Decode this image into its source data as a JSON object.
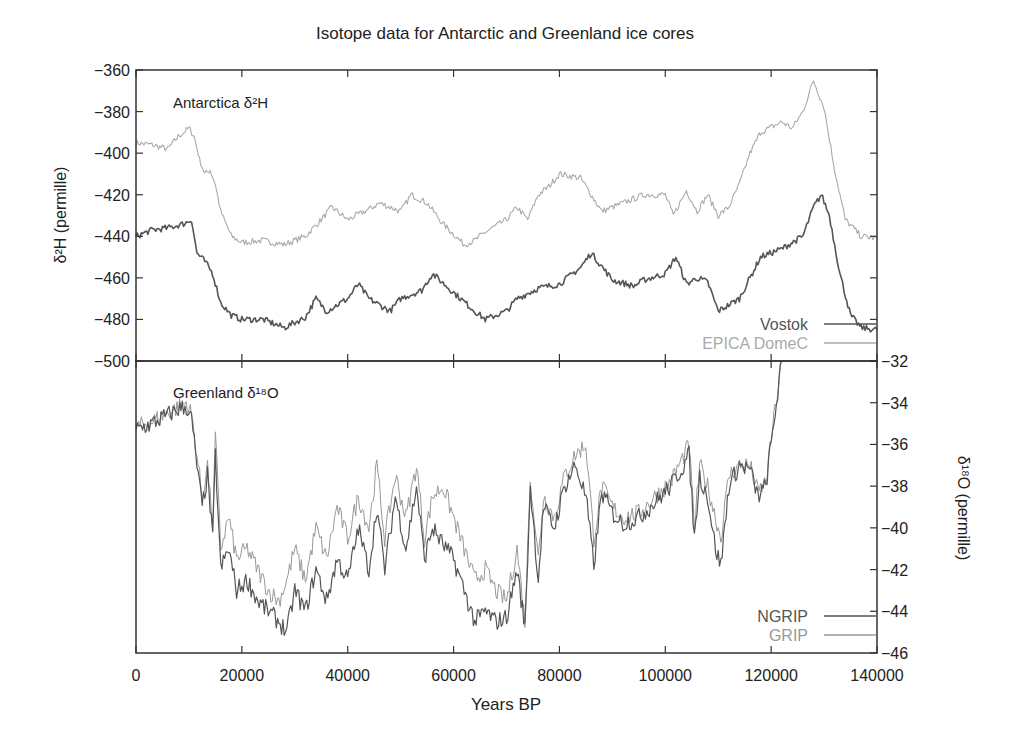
{
  "chart_data": {
    "type": "line",
    "title": "Isotope data for Antarctic and Greenland ice cores",
    "xlabel": "Years BP",
    "xlim": [
      0,
      140000
    ],
    "x_ticks": [
      0,
      20000,
      40000,
      60000,
      80000,
      100000,
      120000,
      140000
    ],
    "x_tick_labels": [
      "0",
      "20000",
      "40000",
      "60000",
      "80000",
      "100000",
      "120000",
      "140000"
    ],
    "grid": false,
    "panels": [
      {
        "name": "Antarctica",
        "panel_label": "Antarctica δ²H",
        "ylabel": "δ²H (permille)",
        "y_axis_side": "left",
        "ylim": [
          -500,
          -360
        ],
        "y_ticks": [
          -360,
          -380,
          -400,
          -420,
          -440,
          -460,
          -480,
          -500
        ],
        "y_tick_labels": [
          "−360",
          "−380",
          "−400",
          "−420",
          "−440",
          "−460",
          "−480",
          "−500"
        ],
        "legend_position": "lower right",
        "series": [
          {
            "name": "Vostok",
            "color": "#555555",
            "x": [
              0,
              3000,
              6000,
              9000,
              10500,
              11500,
              13000,
              14500,
              16000,
              18000,
              20000,
              24000,
              28000,
              32000,
              34000,
              36000,
              40000,
              42000,
              44000,
              46000,
              48000,
              50000,
              54000,
              56000,
              60000,
              64000,
              66000,
              70000,
              72000,
              76000,
              80000,
              84000,
              86000,
              90000,
              94000,
              96000,
              100000,
              102000,
              104000,
              106000,
              108000,
              110000,
              114000,
              118000,
              122000,
              126000,
              128000,
              129500,
              131000,
              133000,
              135000,
              137000,
              140000
            ],
            "y": [
              -440,
              -437,
              -436,
              -434,
              -432,
              -448,
              -452,
              -458,
              -472,
              -478,
              -480,
              -480,
              -484,
              -479,
              -470,
              -476,
              -470,
              -463,
              -470,
              -473,
              -476,
              -470,
              -466,
              -458,
              -467,
              -476,
              -480,
              -476,
              -470,
              -465,
              -463,
              -455,
              -448,
              -461,
              -464,
              -461,
              -458,
              -450,
              -463,
              -460,
              -462,
              -476,
              -470,
              -450,
              -446,
              -440,
              -426,
              -420,
              -430,
              -458,
              -478,
              -484,
              -485
            ]
          },
          {
            "name": "EPICA DomeC",
            "color": "#aaaaaa",
            "x": [
              0,
              3000,
              6000,
              8000,
              10000,
              11000,
              12000,
              13000,
              14000,
              15000,
              16000,
              18000,
              20000,
              24000,
              28000,
              32000,
              35000,
              37000,
              40000,
              44000,
              46000,
              50000,
              52000,
              55000,
              58000,
              62000,
              64000,
              66000,
              70000,
              72000,
              74000,
              76000,
              78000,
              80000,
              84000,
              86000,
              88000,
              92000,
              96000,
              100000,
              101500,
              104000,
              106000,
              108000,
              110000,
              112000,
              114000,
              116000,
              118000,
              122000,
              124000,
              126000,
              128000,
              130000,
              132000,
              134000,
              137000,
              140000
            ],
            "y": [
              -395,
              -396,
              -398,
              -392,
              -388,
              -392,
              -403,
              -410,
              -408,
              -415,
              -428,
              -440,
              -443,
              -442,
              -444,
              -440,
              -432,
              -426,
              -432,
              -427,
              -424,
              -428,
              -420,
              -424,
              -434,
              -444,
              -442,
              -438,
              -432,
              -426,
              -432,
              -420,
              -416,
              -410,
              -412,
              -420,
              -428,
              -424,
              -420,
              -420,
              -430,
              -418,
              -428,
              -420,
              -430,
              -426,
              -415,
              -400,
              -390,
              -385,
              -388,
              -380,
              -365,
              -378,
              -408,
              -432,
              -440,
              -441
            ]
          }
        ]
      },
      {
        "name": "Greenland",
        "panel_label": "Greenland δ¹⁸O",
        "ylabel": "δ¹⁸O (permille)",
        "y_axis_side": "right",
        "ylim": [
          -46,
          -32
        ],
        "y_ticks": [
          -32,
          -34,
          -36,
          -38,
          -40,
          -42,
          -44,
          -46
        ],
        "y_tick_labels": [
          "−32",
          "−34",
          "−36",
          "−38",
          "−40",
          "−42",
          "−44",
          "−46"
        ],
        "legend_position": "lower right",
        "series": [
          {
            "name": "NGRIP",
            "color": "#555555",
            "x": [
              0,
              3000,
              6000,
              8000,
              9500,
              10500,
              11500,
              12500,
              13500,
              14500,
              15000,
              16000,
              17500,
              19000,
              21000,
              23000,
              25000,
              27000,
              28500,
              30000,
              32000,
              34000,
              36000,
              38000,
              40000,
              42000,
              44000,
              45500,
              47000,
              49000,
              51000,
              53000,
              54500,
              56000,
              58000,
              60000,
              62000,
              64000,
              66000,
              68000,
              70000,
              72000,
              73500,
              74500,
              76000,
              77000,
              79000,
              81000,
              83000,
              85000,
              86500,
              88000,
              90000,
              92000,
              95000,
              98000,
              101000,
              103000,
              104500,
              105500,
              106500,
              108000,
              109500,
              110500,
              112000,
              114000,
              116000,
              117500,
              119000,
              120500,
              122000
            ],
            "y": [
              -35.3,
              -35.0,
              -34.6,
              -34.3,
              -34.2,
              -34.8,
              -37.0,
              -39.0,
              -37.5,
              -40.5,
              -36.5,
              -42.0,
              -41.0,
              -43.0,
              -42.5,
              -43.5,
              -44.0,
              -44.5,
              -45.0,
              -43.0,
              -44.0,
              -42.0,
              -43.5,
              -41.5,
              -42.5,
              -40.0,
              -42.0,
              -39.0,
              -42.0,
              -38.5,
              -41.0,
              -38.0,
              -41.5,
              -40.0,
              -40.8,
              -41.5,
              -43.0,
              -44.5,
              -44.0,
              -44.5,
              -44.3,
              -42.0,
              -44.8,
              -38.0,
              -42.5,
              -39.0,
              -40.0,
              -38.0,
              -37.0,
              -38.5,
              -41.8,
              -38.3,
              -39.3,
              -39.8,
              -39.5,
              -38.8,
              -38.0,
              -37.2,
              -36.5,
              -40.5,
              -37.5,
              -38.5,
              -41.0,
              -41.8,
              -38.0,
              -37.0,
              -37.2,
              -38.5,
              -38.0,
              -35.0,
              -32.0
            ]
          },
          {
            "name": "GRIP",
            "color": "#999999",
            "x": [
              0,
              3000,
              6000,
              8000,
              9500,
              10500,
              11500,
              12500,
              13500,
              14500,
              15000,
              16000,
              17500,
              19000,
              21000,
              23000,
              25000,
              27000,
              28500,
              30000,
              32000,
              34000,
              36000,
              38000,
              40000,
              42000,
              44000,
              45500,
              47000,
              49000,
              51000,
              53000,
              54500,
              56000,
              58000,
              60000,
              62000,
              64000,
              66000,
              68000,
              70000,
              72000,
              73500,
              74500,
              76000,
              77000,
              79000,
              81000,
              83000,
              85000,
              86500,
              88000,
              90000,
              92000,
              95000,
              98000,
              101000,
              103000,
              104500,
              105500,
              106500,
              108000,
              109500,
              110500,
              112000,
              114000,
              116000,
              117500,
              119000,
              120500,
              122000
            ],
            "y": [
              -35.2,
              -34.9,
              -34.5,
              -34.2,
              -34.0,
              -34.6,
              -36.5,
              -38.5,
              -37.0,
              -40.0,
              -35.5,
              -41.0,
              -39.5,
              -41.5,
              -41.0,
              -42.0,
              -43.0,
              -43.5,
              -42.5,
              -41.0,
              -42.5,
              -40.0,
              -41.5,
              -39.0,
              -40.5,
              -38.5,
              -40.0,
              -37.0,
              -40.5,
              -37.5,
              -39.5,
              -37.0,
              -40.5,
              -38.5,
              -38.0,
              -39.5,
              -41.0,
              -42.5,
              -42.0,
              -43.0,
              -43.5,
              -41.0,
              -44.5,
              -37.5,
              -41.5,
              -38.5,
              -39.5,
              -37.5,
              -36.5,
              -36.0,
              -40.5,
              -38.0,
              -39.0,
              -39.5,
              -39.3,
              -38.5,
              -37.8,
              -36.8,
              -36.0,
              -40.0,
              -37.0,
              -38.0,
              -39.5,
              -40.5,
              -37.5,
              -37.0,
              -37.0,
              -38.3,
              -37.8,
              -34.8,
              -32.0
            ]
          }
        ]
      }
    ]
  },
  "labels": {
    "title": "Isotope data for Antarctic and Greenland ice cores",
    "xlabel": "Years BP",
    "top_ylabel": "δ²H (permille)",
    "bottom_ylabel": "δ¹⁸O (permille)",
    "top_panel_label": "Antarctica δ²H",
    "bottom_panel_label": "Greenland δ¹⁸O"
  }
}
